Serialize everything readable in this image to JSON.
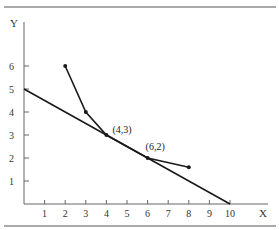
{
  "chart_data": {
    "type": "line",
    "title": "",
    "xlabel": "X",
    "ylabel": "Y",
    "xlim": [
      0,
      10
    ],
    "ylim": [
      0,
      6
    ],
    "x_ticks": [
      1,
      2,
      3,
      4,
      5,
      6,
      7,
      8,
      9,
      10
    ],
    "y_ticks": [
      1,
      2,
      3,
      4,
      5,
      6
    ],
    "grid": false,
    "legend": null,
    "series": [
      {
        "name": "straight line",
        "points": [
          [
            0,
            5
          ],
          [
            10,
            0
          ]
        ]
      },
      {
        "name": "piecewise curve",
        "points": [
          [
            2,
            6
          ],
          [
            3,
            4
          ],
          [
            4,
            3
          ],
          [
            6,
            2
          ],
          [
            8,
            1.6
          ]
        ],
        "markers": true
      }
    ],
    "annotations": [
      {
        "text": "(4,3)",
        "x": 4,
        "y": 3
      },
      {
        "text": "(6,2)",
        "x": 6,
        "y": 2
      }
    ]
  }
}
